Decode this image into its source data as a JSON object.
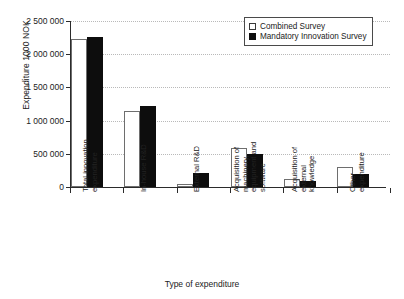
{
  "chart_data": {
    "type": "bar",
    "title": "",
    "xlabel": "Type of expenditure",
    "ylabel": "Expenditure 1000 NOK",
    "ylim": [
      0,
      2500000
    ],
    "grid": true,
    "legend_position": "top-right",
    "categories": [
      "Total innovation expenditure",
      "In-house R&D",
      "External R&D",
      "Acquisition of machinery, equipment and software",
      "Acquisition of external knowledge",
      "Other expenditure"
    ],
    "category_lines": [
      [
        "Total innovation",
        "expenditure"
      ],
      [
        "In-house R&D"
      ],
      [
        "External R&D"
      ],
      [
        "Acquisition of",
        "machinery,",
        "equipment and",
        "software"
      ],
      [
        "Acquisition of",
        "external",
        "knowledge"
      ],
      [
        "Other",
        "expenditure"
      ]
    ],
    "series": [
      {
        "name": "Combined Survey",
        "color": "#ffffff",
        "values": [
          2230000,
          1140000,
          45000,
          590000,
          125000,
          300000
        ]
      },
      {
        "name": "Mandatory Innovation Survey",
        "color": "#0d0d0d",
        "values": [
          2260000,
          1215000,
          205000,
          500000,
          95000,
          200000
        ]
      }
    ],
    "y_ticks": [
      {
        "value": 2500000,
        "label": "2 500 000"
      },
      {
        "value": 2000000,
        "label": "2 000 000"
      },
      {
        "value": 1500000,
        "label": "1 500 000"
      },
      {
        "value": 1000000,
        "label": "1 000 000"
      },
      {
        "value": 500000,
        "label": "500 000"
      },
      {
        "value": 0,
        "label": "0"
      }
    ]
  },
  "legend": {
    "items": [
      {
        "label": "Combined Survey",
        "swatch": "hollow-square-icon"
      },
      {
        "label": "Mandatory Innovation Survey",
        "swatch": "filled-square-icon"
      }
    ]
  },
  "axes": {
    "y_title": "Expenditure 1000 NOK",
    "x_title": "Type of expenditure"
  }
}
